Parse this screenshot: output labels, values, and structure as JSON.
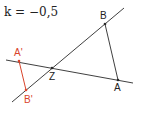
{
  "k_label": "k = −0,5",
  "colors": {
    "line": "#2a2a2a",
    "image": "#d9442b"
  },
  "points": {
    "A": {
      "label": "A",
      "x": 118,
      "y": 80
    },
    "B": {
      "label": "B",
      "x": 105,
      "y": 24
    },
    "Z": {
      "label": "Z",
      "x": 52,
      "y": 68
    },
    "A_prime": {
      "label": "A'",
      "x": 19,
      "y": 61
    },
    "B_prime": {
      "label": "B'",
      "x": 26,
      "y": 90
    }
  },
  "lines": [
    {
      "name": "line-through-A-Z",
      "x1": 6,
      "y1": 60,
      "x2": 133,
      "y2": 83
    },
    {
      "name": "line-through-B-Z",
      "x1": 12,
      "y1": 102,
      "x2": 124,
      "y2": 8
    }
  ]
}
